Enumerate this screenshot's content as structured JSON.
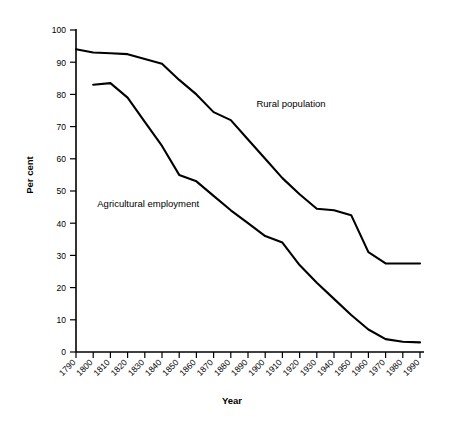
{
  "chart_data": {
    "type": "line",
    "title": "",
    "xlabel": "Year",
    "ylabel": "Per cent",
    "xlim": [
      1790,
      1990
    ],
    "ylim": [
      0,
      100
    ],
    "grid": false,
    "legend_position": "inline-annotations",
    "x": [
      1790,
      1800,
      1810,
      1820,
      1830,
      1840,
      1850,
      1860,
      1870,
      1880,
      1890,
      1900,
      1910,
      1920,
      1930,
      1940,
      1950,
      1960,
      1970,
      1980,
      1990
    ],
    "xtick_labels": [
      "1790",
      "1800",
      "1810",
      "1820",
      "1830",
      "1840",
      "1850",
      "1860",
      "1870",
      "1880",
      "1890",
      "1900",
      "1910",
      "1920",
      "1930",
      "1940",
      "1950",
      "1960",
      "1970",
      "1980",
      "1990"
    ],
    "ytick_labels": [
      "0",
      "10",
      "20",
      "30",
      "40",
      "50",
      "60",
      "70",
      "80",
      "90",
      "100"
    ],
    "yticks": [
      0,
      10,
      20,
      30,
      40,
      50,
      60,
      70,
      80,
      90,
      100
    ],
    "series": [
      {
        "name": "Rural population",
        "label_text": "Rural population",
        "color": "#000000",
        "x": [
          1790,
          1800,
          1810,
          1820,
          1830,
          1840,
          1850,
          1860,
          1870,
          1880,
          1890,
          1900,
          1910,
          1920,
          1930,
          1940,
          1950,
          1960,
          1970,
          1980,
          1990
        ],
        "values": [
          94.0,
          93.0,
          92.8,
          92.5,
          91.0,
          89.5,
          84.5,
          80.0,
          74.5,
          72.0,
          66.0,
          60.0,
          54.0,
          49.0,
          44.5,
          44.0,
          42.5,
          31.0,
          27.5,
          27.5,
          27.5
        ]
      },
      {
        "name": "Agricultural employment",
        "label_text": "Agricultural employment",
        "color": "#000000",
        "x": [
          1800,
          1810,
          1820,
          1830,
          1840,
          1850,
          1860,
          1870,
          1880,
          1890,
          1900,
          1910,
          1920,
          1930,
          1940,
          1950,
          1960,
          1970,
          1980,
          1990
        ],
        "values": [
          83.0,
          83.5,
          79.0,
          71.5,
          64.0,
          55.0,
          53.0,
          48.5,
          44.0,
          40.0,
          36.0,
          34.0,
          27.0,
          21.5,
          16.5,
          11.5,
          7.0,
          4.0,
          3.2,
          3.0
        ]
      }
    ],
    "annotations": [
      {
        "text": "Rural population",
        "x": 1915,
        "y": 76
      },
      {
        "text": "Agricultural employment",
        "x": 1832,
        "y": 45
      }
    ]
  },
  "axes": {
    "y_axis_title": "Per cent",
    "x_axis_title": "Year"
  }
}
